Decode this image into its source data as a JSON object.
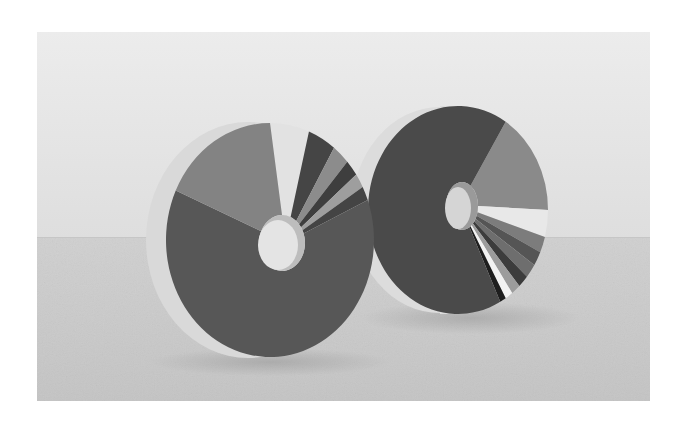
{
  "photo": {
    "frame": {
      "x": 37,
      "y": 32,
      "width": 613,
      "height": 369
    },
    "background_color": "#ffffff",
    "wall": {
      "top_color": "#ececec",
      "bottom_color": "#dedede"
    },
    "floor": {
      "horizon_y": 237,
      "top_color": "#d0d0d0",
      "bottom_color": "#c4c4c4"
    },
    "grayscale": true
  },
  "objects": [
    {
      "name": "left-donut-sculpture",
      "side": {
        "cx": 248,
        "cy": 240,
        "rx": 102,
        "ry": 118,
        "color": "#d9d9d9"
      },
      "face": {
        "cx": 270,
        "cy": 240,
        "rx": 104,
        "ry": 117
      },
      "hole": {
        "cx": 282,
        "cy": 243,
        "rx": 23,
        "ry": 28,
        "color": "#e4e4e4",
        "inner_shadow": "#bdbdbd"
      },
      "slices": [
        {
          "start": 270,
          "end": 292,
          "color": "#e2e2e2"
        },
        {
          "start": 292,
          "end": 308,
          "color": "#454545"
        },
        {
          "start": 308,
          "end": 318,
          "color": "#8c8c8c"
        },
        {
          "start": 318,
          "end": 326,
          "color": "#3e3e3e"
        },
        {
          "start": 326,
          "end": 333,
          "color": "#9e9e9e"
        },
        {
          "start": 333,
          "end": 340,
          "color": "#444444"
        },
        {
          "start": 340,
          "end": 565,
          "color": "#575757"
        },
        {
          "start": 565,
          "end": 630,
          "color": "#838383"
        }
      ]
    },
    {
      "name": "right-donut-sculpture",
      "side": {
        "cx": 440,
        "cy": 210,
        "rx": 88,
        "ry": 103,
        "color": "#dcdcdc"
      },
      "face": {
        "cx": 458,
        "cy": 210,
        "rx": 90,
        "ry": 104
      },
      "hole": {
        "cx": 462,
        "cy": 206,
        "rx": 16,
        "ry": 24,
        "color": "#d5d5d5",
        "inner_shadow": "#9a9a9a"
      },
      "slices": [
        {
          "start": 302,
          "end": 360,
          "color": "#8a8a8a"
        },
        {
          "start": 360,
          "end": 375,
          "color": "#e8e8e8"
        },
        {
          "start": 375,
          "end": 384,
          "color": "#7c7c7c"
        },
        {
          "start": 384,
          "end": 392,
          "color": "#555555"
        },
        {
          "start": 392,
          "end": 400,
          "color": "#6e6e6e"
        },
        {
          "start": 400,
          "end": 407,
          "color": "#3c3c3c"
        },
        {
          "start": 407,
          "end": 413,
          "color": "#9c9c9c"
        },
        {
          "start": 413,
          "end": 418,
          "color": "#f2f2f2"
        },
        {
          "start": 418,
          "end": 422,
          "color": "#1e1e1e"
        },
        {
          "start": 422,
          "end": 662,
          "color": "#4a4a4a"
        }
      ]
    }
  ]
}
